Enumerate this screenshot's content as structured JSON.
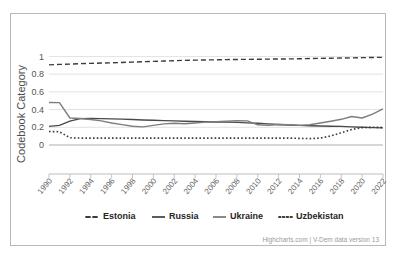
{
  "chart_data": {
    "type": "line",
    "title": "",
    "xlabel": "",
    "ylabel": "Codebook Category",
    "ylim": [
      0,
      1.05
    ],
    "xlim": [
      1990,
      2022
    ],
    "grid": true,
    "legend_position": "bottom",
    "credits": "Highcharts.com | V-Dem data version 13",
    "y_ticks": [
      "0",
      "0.2",
      "0.4",
      "0.6",
      "0.8",
      "1"
    ],
    "y_tick_values": [
      0,
      0.2,
      0.4,
      0.6,
      0.8,
      1
    ],
    "x_ticks": [
      "1990",
      "1992",
      "1994",
      "1996",
      "1998",
      "2000",
      "2002",
      "2004",
      "2006",
      "2008",
      "2010",
      "2012",
      "2014",
      "2016",
      "2018",
      "2020",
      "2022"
    ],
    "x": [
      1990,
      1991,
      1992,
      1993,
      1994,
      1995,
      1996,
      1997,
      1998,
      1999,
      2000,
      2001,
      2002,
      2003,
      2004,
      2005,
      2006,
      2007,
      2008,
      2009,
      2010,
      2011,
      2012,
      2013,
      2014,
      2015,
      2016,
      2017,
      2018,
      2019,
      2020,
      2021,
      2022
    ],
    "series": [
      {
        "name": "Estonia",
        "style": "dashed",
        "color": "#3b3b3b",
        "values": [
          0.905,
          0.91,
          0.913,
          0.918,
          0.922,
          0.925,
          0.928,
          0.932,
          0.936,
          0.94,
          0.944,
          0.948,
          0.952,
          0.956,
          0.958,
          0.96,
          0.962,
          0.964,
          0.966,
          0.967,
          0.968,
          0.97,
          0.971,
          0.972,
          0.974,
          0.976,
          0.978,
          0.98,
          0.982,
          0.984,
          0.986,
          0.988,
          0.99
        ]
      },
      {
        "name": "Russia",
        "style": "solid",
        "color": "#4a4a4a",
        "values": [
          0.21,
          0.222,
          0.27,
          0.298,
          0.3,
          0.298,
          0.295,
          0.292,
          0.288,
          0.283,
          0.28,
          0.275,
          0.272,
          0.268,
          0.265,
          0.262,
          0.26,
          0.258,
          0.256,
          0.25,
          0.245,
          0.238,
          0.232,
          0.226,
          0.222,
          0.218,
          0.215,
          0.212,
          0.21,
          0.205,
          0.2,
          0.196,
          0.193
        ]
      },
      {
        "name": "Ukraine",
        "style": "solid",
        "color": "#7d7d7d",
        "values": [
          0.48,
          0.478,
          0.305,
          0.3,
          0.288,
          0.272,
          0.248,
          0.23,
          0.212,
          0.205,
          0.222,
          0.238,
          0.245,
          0.24,
          0.248,
          0.258,
          0.262,
          0.268,
          0.275,
          0.272,
          0.228,
          0.222,
          0.232,
          0.228,
          0.222,
          0.228,
          0.248,
          0.268,
          0.29,
          0.322,
          0.305,
          0.348,
          0.408
        ]
      },
      {
        "name": "Uzbekistan",
        "style": "dotted",
        "color": "#3b3b3b",
        "values": [
          0.152,
          0.15,
          0.082,
          0.078,
          0.078,
          0.078,
          0.078,
          0.078,
          0.078,
          0.078,
          0.078,
          0.078,
          0.078,
          0.078,
          0.078,
          0.078,
          0.078,
          0.078,
          0.078,
          0.078,
          0.078,
          0.078,
          0.078,
          0.078,
          0.075,
          0.072,
          0.078,
          0.102,
          0.138,
          0.175,
          0.196,
          0.2,
          0.198
        ]
      }
    ]
  },
  "legend": {
    "items": [
      {
        "label": "Estonia",
        "marker": "dashed"
      },
      {
        "label": "Russia",
        "marker": "solid"
      },
      {
        "label": "Ukraine",
        "marker": "solid"
      },
      {
        "label": "Uzbekistan",
        "marker": "dotted"
      }
    ]
  },
  "axis": {
    "y_title": "Codebook Category"
  },
  "footer": {
    "credits": "Highcharts.com | V-Dem data version 13"
  }
}
